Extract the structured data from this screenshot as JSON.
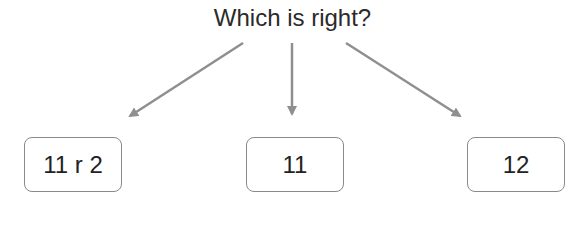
{
  "question": "Which is right?",
  "options": [
    {
      "label": "11 r 2"
    },
    {
      "label": "11"
    },
    {
      "label": "12"
    }
  ],
  "colors": {
    "arrow": "#8f8f8f",
    "box_border": "#8a8a8a",
    "text": "#2b2b2b"
  }
}
